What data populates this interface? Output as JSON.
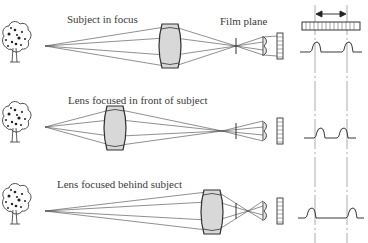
{
  "diagram": {
    "rows": [
      {
        "id": "in-focus",
        "caption": "Subject in focus",
        "lens_x": 170,
        "signal": "peaks-at-reference"
      },
      {
        "id": "front-focus",
        "caption": "Lens focused in front of subject",
        "lens_x": 115,
        "signal": "peaks-closer-together"
      },
      {
        "id": "back-focus",
        "caption": "Lens focused behind subject",
        "lens_x": 212,
        "signal": "peaks-farther-apart"
      }
    ],
    "film_plane_label": "Film plane",
    "sensor_bar": "line-sensor-array",
    "separation_arrow": "double-headed-arrow"
  }
}
